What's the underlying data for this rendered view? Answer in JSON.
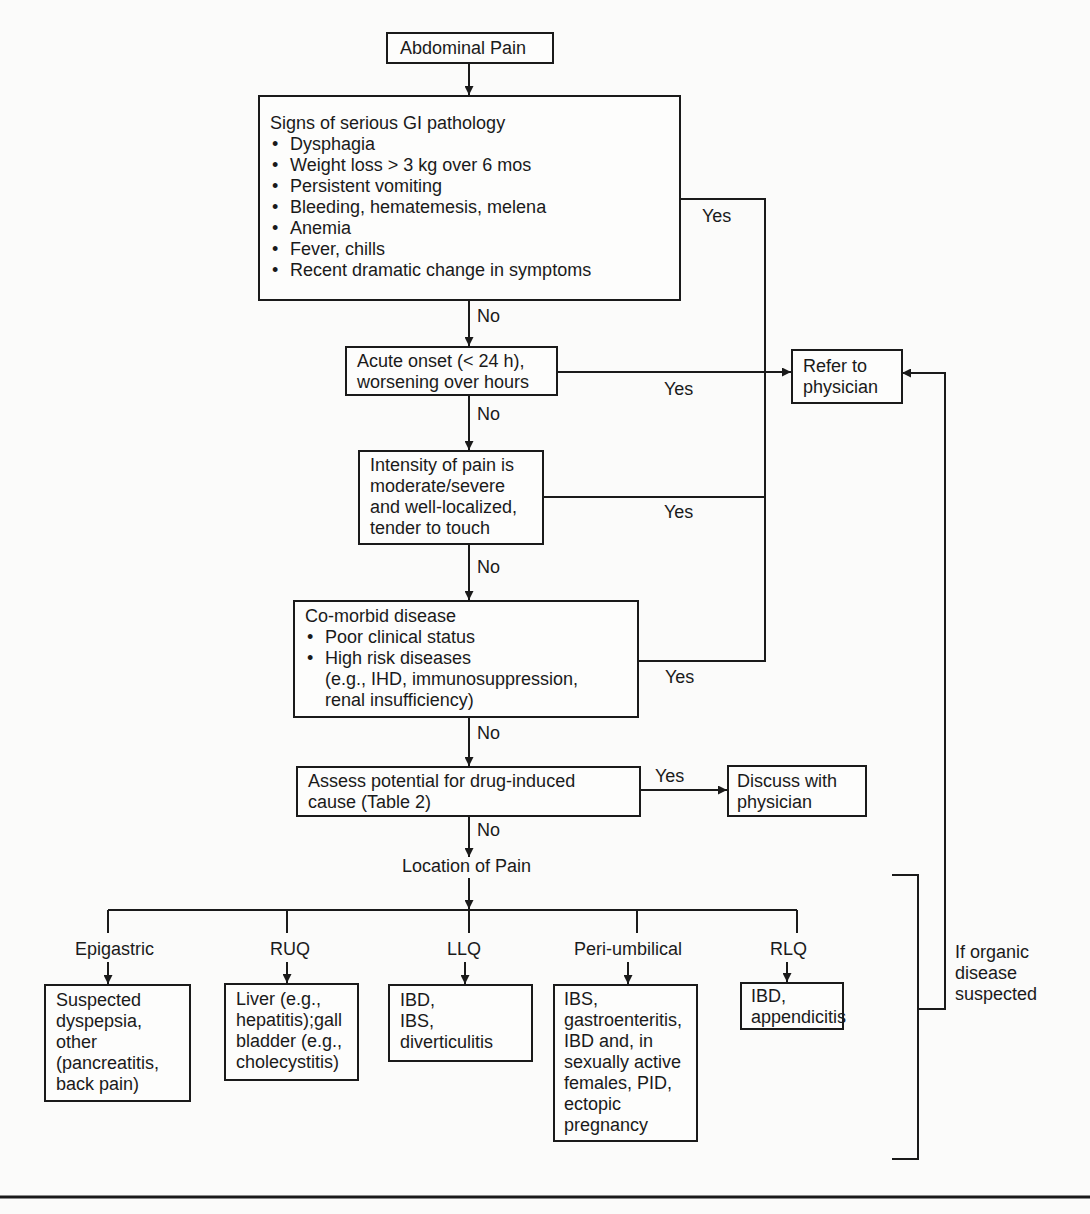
{
  "title": "Abdominal Pain",
  "serious_gi": {
    "heading": "Signs of serious GI pathology",
    "items": [
      "Dysphagia",
      "Weight loss > 3 kg over 6 mos",
      "Persistent vomiting",
      "Bleeding, hematemesis, melena",
      "Anemia",
      "Fever, chills",
      "Recent dramatic change in symptoms"
    ]
  },
  "acute": {
    "line1": "Acute onset  (< 24 h),",
    "line2": "worsening over hours"
  },
  "intensity": {
    "line1": "Intensity  of pain is",
    "line2": "moderate/severe",
    "line3": "and well-localized,",
    "line4": "tender to touch"
  },
  "comorbid": {
    "heading": "Co-morbid disease",
    "items": [
      "Poor clinical status",
      "High risk diseases"
    ],
    "sub1": "(e.g., IHD, immunosuppression,",
    "sub2": "renal insufficiency)"
  },
  "assess": {
    "line1": "Assess potential for drug-induced",
    "line2": "cause (Table 2)"
  },
  "refer": {
    "line1": "Refer to",
    "line2": "physician"
  },
  "discuss": {
    "line1": "Discuss with",
    "line2": "physician"
  },
  "location": "Location of Pain",
  "edge_labels": {
    "yes": "Yes",
    "no": "No"
  },
  "branches": [
    {
      "label": "Epigastric",
      "lines": [
        "Suspected",
        "dyspepsia,",
        "other",
        "(pancreatitis,",
        "back pain)"
      ]
    },
    {
      "label": "RUQ",
      "lines": [
        "Liver (e.g.,",
        "hepatitis);gall",
        "bladder (e.g.,",
        "cholecystitis)"
      ]
    },
    {
      "label": "LLQ",
      "lines": [
        "IBD,",
        "IBS,",
        "diverticulitis"
      ]
    },
    {
      "label": "Peri-umbilical",
      "lines": [
        "IBS,",
        "gastroenteritis,",
        "IBD and, in",
        "sexually active",
        "females, PID,",
        "ectopic",
        "pregnancy"
      ]
    },
    {
      "label": "RLQ",
      "lines": [
        "IBD,",
        "appendicitis"
      ]
    }
  ],
  "organic": {
    "line1": "If organic",
    "line2": "disease",
    "line3": "suspected"
  }
}
